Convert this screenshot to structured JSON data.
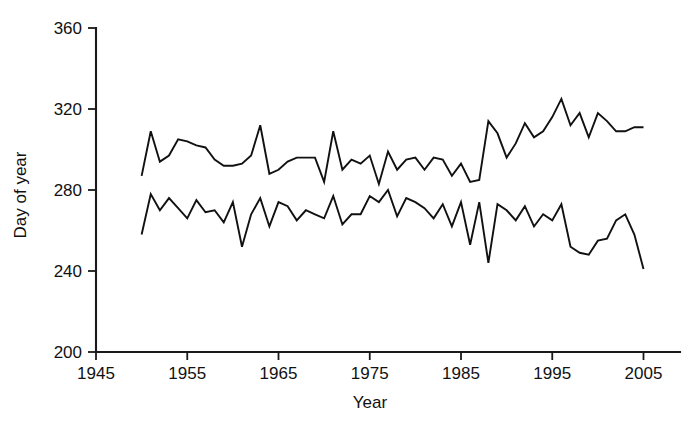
{
  "chart_data": {
    "type": "line",
    "title": "",
    "subtitle": "",
    "xlabel": "Year",
    "ylabel": "Day of year",
    "xlim": [
      1945,
      2009
    ],
    "ylim": [
      200,
      360
    ],
    "xticks": [
      1945,
      1955,
      1965,
      1975,
      1985,
      1995,
      2005
    ],
    "xtick_labels": [
      "1945",
      "1955",
      "1965",
      "1975",
      "1985",
      "1995",
      "2005"
    ],
    "yticks": [
      200,
      240,
      280,
      320,
      360
    ],
    "ytick_labels": [
      "200",
      "240",
      "280",
      "320",
      "360"
    ],
    "grid": false,
    "legend": null,
    "legend_position": "none",
    "annotations": [],
    "line_color": "#111111",
    "x": [
      1950,
      1951,
      1952,
      1953,
      1954,
      1955,
      1956,
      1957,
      1958,
      1959,
      1960,
      1961,
      1962,
      1963,
      1964,
      1965,
      1966,
      1967,
      1968,
      1969,
      1970,
      1971,
      1972,
      1973,
      1974,
      1975,
      1976,
      1977,
      1978,
      1979,
      1980,
      1981,
      1982,
      1983,
      1984,
      1985,
      1986,
      1987,
      1988,
      1989,
      1990,
      1991,
      1992,
      1993,
      1994,
      1995,
      1996,
      1997,
      1998,
      1999,
      2000,
      2001,
      2002,
      2003,
      2004,
      2005
    ],
    "series": [
      {
        "name": "upper",
        "values": [
          287,
          309,
          294,
          297,
          305,
          304,
          302,
          301,
          295,
          292,
          292,
          293,
          297,
          312,
          288,
          290,
          294,
          296,
          296,
          296,
          284,
          309,
          290,
          295,
          293,
          297,
          283,
          299,
          290,
          295,
          296,
          290,
          296,
          295,
          287,
          293,
          284,
          285,
          314,
          308,
          296,
          303,
          313,
          306,
          309,
          316,
          325,
          312,
          318,
          306,
          318,
          314,
          309,
          309,
          311,
          311
        ]
      },
      {
        "name": "lower",
        "values": [
          258,
          278,
          270,
          276,
          271,
          266,
          275,
          269,
          270,
          264,
          274,
          252,
          268,
          276,
          262,
          274,
          272,
          265,
          270,
          268,
          266,
          277,
          263,
          268,
          268,
          277,
          274,
          280,
          267,
          276,
          274,
          271,
          266,
          273,
          262,
          274,
          253,
          274,
          244,
          273,
          270,
          265,
          272,
          262,
          268,
          265,
          273,
          252,
          249,
          248,
          255,
          256,
          265,
          268,
          258,
          241
        ]
      }
    ]
  }
}
